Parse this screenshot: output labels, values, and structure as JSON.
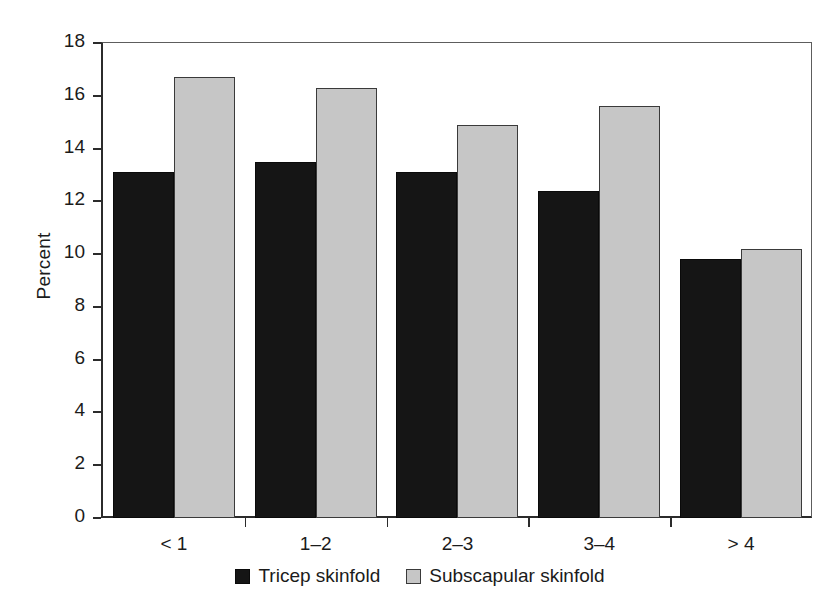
{
  "chart_data": {
    "type": "bar",
    "title": "",
    "xlabel": "",
    "ylabel": "Percent",
    "ylim": [
      0,
      18
    ],
    "ytick_step": 2,
    "yticks": [
      0,
      2,
      4,
      6,
      8,
      10,
      12,
      14,
      16,
      18
    ],
    "ytick_labels": [
      "0",
      "2",
      "4",
      "6",
      "8",
      "10",
      "12",
      "14",
      "16",
      "18"
    ],
    "grid": false,
    "legend_position": "bottom-center",
    "categories": [
      "< 1",
      "1–2",
      "2–3",
      "3–4",
      "> 4"
    ],
    "series": [
      {
        "name": "Tricep skinfold",
        "color": "#151515",
        "values": [
          13.1,
          13.5,
          13.1,
          12.4,
          9.8
        ]
      },
      {
        "name": "Subscapular skinfold",
        "color": "#c6c6c6",
        "values": [
          16.7,
          16.3,
          14.9,
          15.6,
          10.2
        ]
      }
    ]
  },
  "axes": {
    "y_title": "Percent"
  },
  "legend": {
    "items": [
      {
        "label": "Tricep skinfold",
        "swatch": "black-square-swatch"
      },
      {
        "label": "Subscapular skinfold",
        "swatch": "gray-square-swatch"
      }
    ]
  }
}
